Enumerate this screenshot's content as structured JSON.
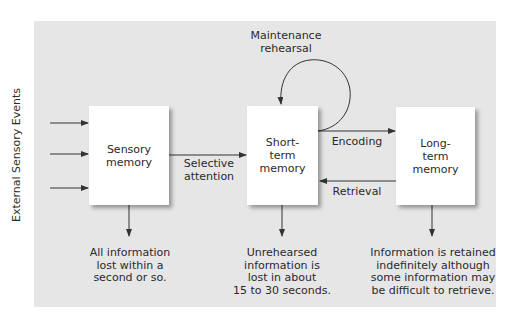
{
  "diagram": {
    "side_label": "External Sensory Events",
    "boxes": {
      "sensory": "Sensory\nmemory",
      "short_term": "Short-\nterm\nmemory",
      "long_term": "Long-\nterm\nmemory"
    },
    "edges": {
      "selective_attention": "Selective\nattention",
      "maintenance_rehearsal": "Maintenance\nrehearsal",
      "encoding": "Encoding",
      "retrieval": "Retrieval"
    },
    "notes": {
      "sensory": "All information\nlost within a\nsecond or so.",
      "short_term": "Unrehearsed\ninformation is\nlost in about\n15 to 30 seconds.",
      "long_term": "Information is retained\nindefinitely although\nsome information may\nbe difficult to retrieve."
    },
    "colors": {
      "panel": "#e6e6e6",
      "box": "#ffffff",
      "line": "#333333"
    }
  }
}
